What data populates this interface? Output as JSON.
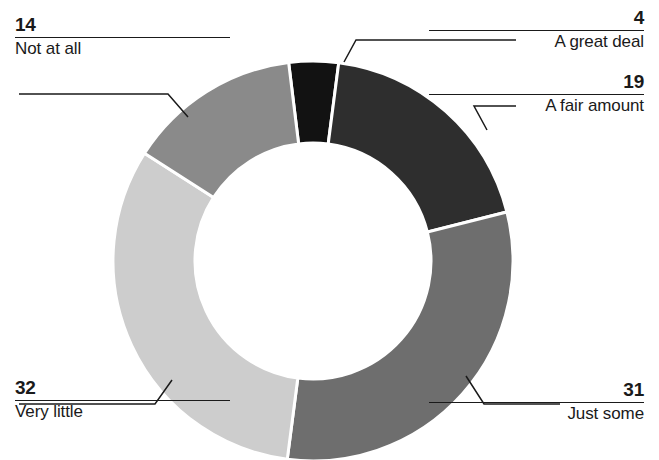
{
  "chart_data": {
    "type": "pie",
    "variant": "donut",
    "title": "",
    "subtitle": "",
    "xlabel": "",
    "ylabel": "",
    "units": "percent",
    "total": 100,
    "legend_position": "callout-labels",
    "grid": false,
    "start_angle_deg": -7,
    "direction": "clockwise",
    "inner_radius_ratio": 0.59,
    "categories": [
      "A great deal",
      "A fair amount",
      "Just some",
      "Very little",
      "Not at all"
    ],
    "values": [
      4,
      19,
      31,
      32,
      14
    ],
    "slices": [
      {
        "label": "A great deal",
        "value": 4,
        "color": "#121212",
        "callout_side": "right"
      },
      {
        "label": "A fair amount",
        "value": 19,
        "color": "#2e2e2e",
        "callout_side": "right"
      },
      {
        "label": "Just some",
        "value": 31,
        "color": "#6e6e6e",
        "callout_side": "right"
      },
      {
        "label": "Very little",
        "value": 32,
        "color": "#cdcdcd",
        "callout_side": "left"
      },
      {
        "label": "Not at all",
        "value": 14,
        "color": "#8a8a8a",
        "callout_side": "left"
      }
    ]
  },
  "callouts": {
    "great_deal": {
      "value": "4",
      "label": "A great deal"
    },
    "fair_amount": {
      "value": "19",
      "label": "A fair amount"
    },
    "just_some": {
      "value": "31",
      "label": "Just some"
    },
    "very_little": {
      "value": "32",
      "label": "Very little"
    },
    "not_at_all": {
      "value": "14",
      "label": "Not at all"
    }
  },
  "colors": {
    "background": "#ffffff",
    "text": "#1a1a1a",
    "slice_separator": "#ffffff",
    "leader_line": "#1a1a1a"
  }
}
